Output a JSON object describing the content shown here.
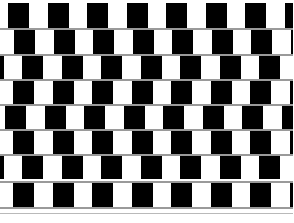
{
  "figure": {
    "width": 293,
    "height": 223,
    "background_color": "#ffffff",
    "tile_black_color": "#000000",
    "tile_white_color": "#ffffff",
    "mortar_color": "#9a9a9a",
    "mortar_faint_color": "#b9b9b9",
    "tile_width": 21,
    "tile_period": 39.5,
    "tiles_per_row": 11,
    "row_count": 8
  },
  "rows": [
    {
      "index": 1,
      "top": 3,
      "height": 25,
      "offset": 8,
      "label": "tile-row-1"
    },
    {
      "index": 2,
      "top": 30,
      "height": 24,
      "offset": 14,
      "label": "tile-row-2"
    },
    {
      "index": 3,
      "top": 56,
      "height": 23,
      "offset": 22,
      "label": "tile-row-3"
    },
    {
      "index": 4,
      "top": 81,
      "height": 23,
      "offset": 13,
      "label": "tile-row-4"
    },
    {
      "index": 5,
      "top": 106,
      "height": 23,
      "offset": 5,
      "label": "tile-row-5"
    },
    {
      "index": 6,
      "top": 131,
      "height": 23,
      "offset": 13,
      "label": "tile-row-6"
    },
    {
      "index": 7,
      "top": 156,
      "height": 23,
      "offset": 22,
      "label": "tile-row-7"
    },
    {
      "index": 8,
      "top": 183,
      "height": 24,
      "offset": 13,
      "label": "tile-row-8"
    }
  ],
  "mortar_lines": [
    {
      "index": 1,
      "top": 28,
      "faint": false,
      "label": "mortar-line-1"
    },
    {
      "index": 2,
      "top": 54,
      "faint": false,
      "label": "mortar-line-2"
    },
    {
      "index": 3,
      "top": 79,
      "faint": false,
      "label": "mortar-line-3"
    },
    {
      "index": 4,
      "top": 104,
      "faint": false,
      "label": "mortar-line-4"
    },
    {
      "index": 5,
      "top": 129,
      "faint": false,
      "label": "mortar-line-5"
    },
    {
      "index": 6,
      "top": 154,
      "faint": false,
      "label": "mortar-line-6"
    },
    {
      "index": 7,
      "top": 181,
      "faint": false,
      "label": "mortar-line-7"
    },
    {
      "index": 8,
      "top": 207,
      "faint": false,
      "label": "mortar-line-8"
    },
    {
      "index": 9,
      "top": 213,
      "faint": true,
      "label": "mortar-line-shadow"
    }
  ]
}
